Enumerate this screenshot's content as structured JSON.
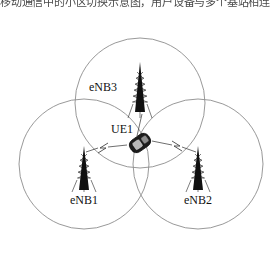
{
  "page": {
    "background_color": "#ffffff",
    "width": 278,
    "height": 256
  },
  "clipped_caption": {
    "text": "移动通信中的小区切换示意图，用户设备与多个基站相连",
    "note_visible": "only the bottom sliver of a line of CJK text is visible at the very top edge"
  },
  "diagram": {
    "colors": {
      "circle_stroke": "#8d8d8d",
      "tower_fill": "#101010",
      "link_stroke": "#4a4a4a",
      "label_color": "#111111",
      "ue_body": "#1d1d1d",
      "ue_screen": "#b9b9b9"
    },
    "cells": [
      {
        "id": "cell-enb3",
        "label": "eNB3",
        "center_x": 140,
        "center_y": 103,
        "radius": 65,
        "tower_x": 140,
        "tower_y": 96,
        "label_x": 103,
        "label_y": 91
      },
      {
        "id": "cell-enb1",
        "label": "eNB1",
        "center_x": 84,
        "center_y": 164,
        "radius": 65,
        "tower_x": 84,
        "tower_y": 176,
        "label_x": 84,
        "label_y": 202
      },
      {
        "id": "cell-enb2",
        "label": "eNB2",
        "center_x": 198,
        "center_y": 164,
        "radius": 65,
        "tower_x": 198,
        "tower_y": 176,
        "label_x": 198,
        "label_y": 202
      }
    ],
    "ue": {
      "id": "ue-1",
      "label": "UE1",
      "x": 140,
      "y": 143,
      "label_x": 122,
      "label_y": 133,
      "rotation_deg": -35
    },
    "links": [
      {
        "id": "link-ue1-enb3",
        "from": "UE1",
        "to": "eNB3",
        "has_bolt": false
      },
      {
        "id": "link-ue1-enb1",
        "from": "UE1",
        "to": "eNB1",
        "has_bolt": true
      },
      {
        "id": "link-ue1-enb2",
        "from": "UE1",
        "to": "eNB2",
        "has_bolt": true
      }
    ]
  }
}
